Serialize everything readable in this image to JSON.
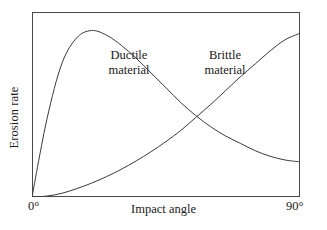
{
  "axes": {
    "y_title": "Erosion rate",
    "x_title": "Impact angle",
    "x_tick_min": "0°",
    "x_tick_max": "90°"
  },
  "annotations": {
    "ductile_line1": "Ductile",
    "ductile_line2": "material",
    "brittle_line1": "Brittle",
    "brittle_line2": "material"
  },
  "colors": {
    "frame": "#4a4a4a",
    "curve": "#3a3a3a",
    "background": "#ffffff",
    "text": "#1a1a1a"
  },
  "chart_data": {
    "type": "line",
    "title": "",
    "xlabel": "Impact angle",
    "ylabel": "Erosion rate",
    "xlim": [
      0,
      90
    ],
    "ylim": [
      0,
      1
    ],
    "xticks": [
      "0°",
      "90°"
    ],
    "yticks": [],
    "grid": false,
    "legend": "inline-annotations",
    "x": [
      0,
      5,
      10,
      15,
      20,
      25,
      30,
      35,
      40,
      45,
      50,
      55,
      60,
      65,
      70,
      75,
      80,
      85,
      90
    ],
    "series": [
      {
        "name": "Ductile material",
        "label_position": "upper-left",
        "values": [
          0.0,
          0.42,
          0.72,
          0.86,
          0.9,
          0.875,
          0.82,
          0.75,
          0.67,
          0.59,
          0.51,
          0.44,
          0.38,
          0.33,
          0.29,
          0.25,
          0.22,
          0.2,
          0.19
        ]
      },
      {
        "name": "Brittle material",
        "label_position": "upper-right",
        "values": [
          0.0,
          0.005,
          0.02,
          0.045,
          0.075,
          0.11,
          0.15,
          0.195,
          0.245,
          0.3,
          0.36,
          0.43,
          0.5,
          0.575,
          0.65,
          0.72,
          0.79,
          0.85,
          0.885
        ]
      }
    ],
    "annotations": [
      {
        "text": "Ductile material",
        "x": 24,
        "y": 0.83
      },
      {
        "text": "Brittle material",
        "x": 58,
        "y": 0.83
      }
    ],
    "crossing_point": {
      "x": 53,
      "y": 0.47
    }
  }
}
